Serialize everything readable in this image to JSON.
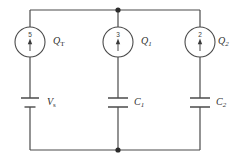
{
  "diagram": {
    "type": "electrical-schematic",
    "colors": {
      "wire": "#4a4a4a",
      "node": "#2b2b2b",
      "background": "#ffffff",
      "text": "#2f2f2f"
    }
  },
  "branches": [
    {
      "id": "source-branch",
      "meter": {
        "name": "meter-qt",
        "reading": "5",
        "label_main": "Q",
        "label_sub": "T",
        "label_full": "Q_T",
        "arrow_direction": "up"
      },
      "component": {
        "name": "voltage-source",
        "kind": "battery",
        "label_main": "V",
        "label_sub": "s",
        "label_full": "V_s"
      }
    },
    {
      "id": "c1-branch",
      "meter": {
        "name": "meter-q1",
        "reading": "3",
        "label_main": "Q",
        "label_sub": "1",
        "label_full": "Q_1",
        "arrow_direction": "up"
      },
      "component": {
        "name": "capacitor-c1",
        "kind": "capacitor",
        "label_main": "C",
        "label_sub": "1",
        "label_full": "C_1"
      }
    },
    {
      "id": "c2-branch",
      "meter": {
        "name": "meter-q2",
        "reading": "2",
        "label_main": "Q",
        "label_sub": "2",
        "label_full": "Q_2",
        "arrow_direction": "up"
      },
      "component": {
        "name": "capacitor-c2",
        "kind": "capacitor",
        "label_main": "C",
        "label_sub": "2",
        "label_full": "C_2"
      }
    }
  ],
  "nodes": [
    {
      "name": "top-junction",
      "x": 118,
      "y": 10
    },
    {
      "name": "bottom-junction",
      "x": 118,
      "y": 150
    }
  ]
}
